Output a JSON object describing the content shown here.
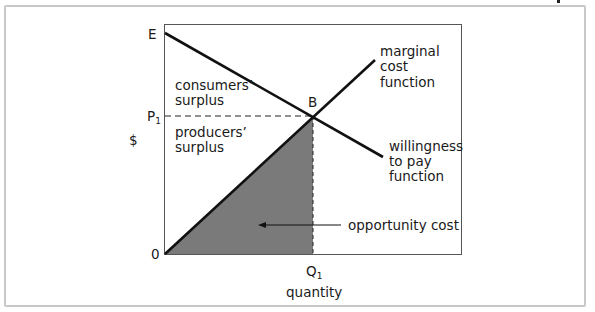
{
  "diagram": {
    "type": "economic-surplus",
    "axes": {
      "y_label": "$",
      "x_label": "quantity",
      "origin_label": "0",
      "y_top_label": "E",
      "price_label": "P",
      "price_subscript": "1",
      "quantity_label": "Q",
      "quantity_subscript": "1"
    },
    "point": {
      "label": "B"
    },
    "curves": {
      "marginal_cost": {
        "lines": [
          "marginal",
          "cost",
          "function"
        ]
      },
      "willingness_to_pay": {
        "lines": [
          "willingness",
          "to pay",
          "function"
        ]
      }
    },
    "regions": {
      "consumers_surplus": {
        "lines": [
          "consumers’",
          "surplus"
        ]
      },
      "producers_surplus": {
        "lines": [
          "producers’",
          "surplus"
        ]
      },
      "opportunity_cost": {
        "label": "opportunity cost",
        "fill": "#7a7a7a"
      }
    },
    "colors": {
      "line": "#111111",
      "frame": "#c8c8c8",
      "plot_border": "#555555",
      "shade": "#7a7a7a"
    }
  }
}
